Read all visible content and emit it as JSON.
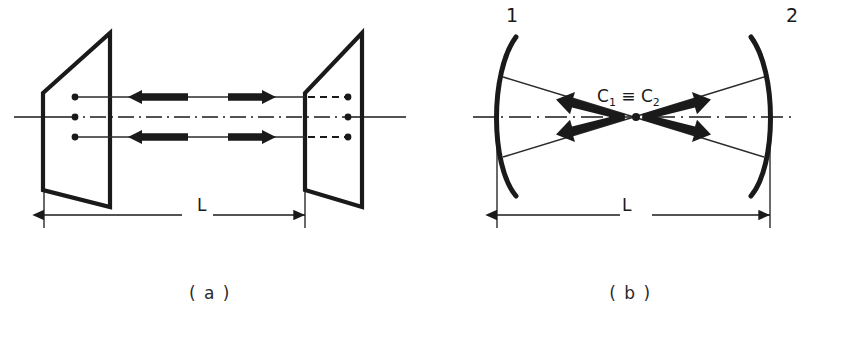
{
  "figure": {
    "kind": "optical-resonator-diagram",
    "panels": [
      {
        "id": "a",
        "caption": "( a )",
        "type": "plane-parallel-resonator",
        "length_label": "L",
        "mirrors": [
          {
            "name": "left-plane-mirror",
            "shape": "flat-plate-perspective"
          },
          {
            "name": "right-plane-mirror",
            "shape": "flat-plate-perspective"
          }
        ],
        "ray_count": 3,
        "ray_direction_labels": [
          "leftward",
          "rightward"
        ]
      },
      {
        "id": "b",
        "caption": "( b )",
        "type": "concentric-resonator",
        "length_label": "L",
        "mirror_labels": [
          "1",
          "2"
        ],
        "center_label_html": "C<sub>1</sub> ≡ C<sub>2</sub>",
        "center_label_text": "C1 ≡ C2",
        "mirrors": [
          {
            "name": "mirror-1",
            "shape": "concave-arc",
            "label": "1"
          },
          {
            "name": "mirror-2",
            "shape": "concave-arc",
            "label": "2"
          }
        ],
        "ray_count": 4
      }
    ],
    "colors": {
      "ink": "#1a1a1a",
      "background": "#ffffff",
      "thin_line": "#2b2b2b"
    }
  }
}
